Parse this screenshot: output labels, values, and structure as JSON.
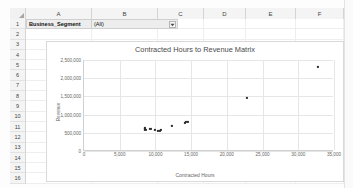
{
  "spreadsheet": {
    "columns": [
      "A",
      "B",
      "C",
      "D",
      "E",
      "F"
    ],
    "rows": [
      "1",
      "2",
      "3",
      "4",
      "5",
      "6",
      "7",
      "8",
      "9",
      "10",
      "11",
      "12",
      "13",
      "14",
      "15",
      "16"
    ],
    "filter": {
      "field_label": "Business_Segment",
      "selected_value": "(All)",
      "dropdown_icon": "chevron-down-icon"
    }
  },
  "chart_data": {
    "type": "scatter",
    "title": "Contracted Hours to Revenue Matrix",
    "xlabel": "Contracted Hours",
    "ylabel": "Revenue",
    "xlim": [
      0,
      35000
    ],
    "ylim": [
      0,
      2500000
    ],
    "grid": true,
    "legend": "none",
    "xticks": [
      0,
      5000,
      10000,
      15000,
      20000,
      25000,
      30000,
      35000
    ],
    "xtick_labels": [
      "0",
      "5,000",
      "10,000",
      "15,000",
      "20,000",
      "25,000",
      "30,000",
      "35,000"
    ],
    "yticks": [
      0,
      500000,
      1000000,
      1500000,
      2000000,
      2500000
    ],
    "ytick_labels": [
      "0",
      "500,000",
      "1,000,000",
      "1,500,000",
      "2,000,000",
      "2,500,000"
    ],
    "series": [
      {
        "name": "Revenue",
        "marker": "square",
        "color": "#2b2b2b",
        "points": [
          [
            8500,
            600000
          ],
          [
            8550,
            640000
          ],
          [
            8600,
            575000
          ],
          [
            9300,
            600000
          ],
          [
            9900,
            580000
          ],
          [
            10300,
            545000
          ],
          [
            10600,
            560000
          ],
          [
            10800,
            590000
          ],
          [
            12300,
            690000
          ],
          [
            14100,
            780000
          ],
          [
            14300,
            800000
          ],
          [
            14500,
            795000
          ],
          [
            22800,
            1450000
          ],
          [
            32800,
            2300000
          ]
        ]
      }
    ]
  }
}
